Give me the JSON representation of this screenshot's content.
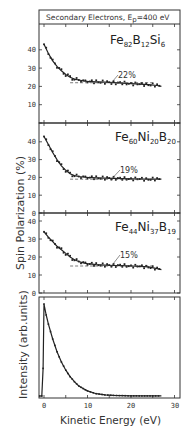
{
  "chart_data": [
    {
      "type": "scatter",
      "panel": "Fe82B12Si6",
      "title": "Secondary Electrons, Ep=400 eV",
      "label_main": [
        "Fe",
        "B",
        "Si"
      ],
      "label_subs": [
        "82",
        "12",
        "6"
      ],
      "annotation": "22%",
      "asymptote": 22,
      "xlabel": "Kinetic Energy (eV)",
      "ylabel": "Spin Polarization (%)",
      "xlim": [
        -1,
        32
      ],
      "ylim": [
        0,
        48
      ],
      "yticks": [
        0,
        10,
        20,
        30,
        40
      ],
      "x": [
        0,
        1,
        2,
        3,
        4,
        5,
        6,
        7,
        8,
        9,
        10,
        12,
        14,
        16,
        18,
        20,
        22,
        24,
        26,
        27
      ],
      "values": [
        43,
        38,
        34,
        31,
        28.5,
        26.5,
        25,
        24,
        23.5,
        23,
        22.8,
        22.5,
        22.3,
        22,
        21.8,
        21.5,
        21.2,
        21,
        20.5,
        20
      ]
    },
    {
      "type": "scatter",
      "panel": "Fe60Ni20B20",
      "label_main": [
        "Fe",
        "Ni",
        "B"
      ],
      "label_subs": [
        "60",
        "20",
        "20"
      ],
      "annotation": "19%",
      "asymptote": 19,
      "ylim": [
        0,
        48
      ],
      "yticks": [
        0,
        10,
        20,
        30,
        40
      ],
      "x": [
        0,
        1,
        2,
        3,
        4,
        5,
        6,
        7,
        8,
        9,
        10,
        12,
        14,
        16,
        18,
        20,
        22,
        24,
        26,
        27
      ],
      "values": [
        43,
        38.5,
        34,
        30,
        26.5,
        24,
        22,
        21,
        20.5,
        20.2,
        20,
        19.8,
        19.6,
        19.5,
        19.3,
        19.2,
        19.1,
        19,
        19,
        19
      ]
    },
    {
      "type": "scatter",
      "panel": "Fe44Ni37B19",
      "label_main": [
        "Fe",
        "Ni",
        "B"
      ],
      "label_subs": [
        "44",
        "37",
        "19"
      ],
      "annotation": "15%",
      "asymptote": 15,
      "ylim": [
        0,
        42
      ],
      "yticks": [
        0,
        10,
        20,
        30,
        40
      ],
      "x": [
        0,
        1,
        2,
        3,
        4,
        5,
        6,
        7,
        8,
        9,
        10,
        12,
        14,
        16,
        18,
        20,
        22,
        24,
        26,
        27
      ],
      "values": [
        34,
        31,
        28.5,
        26,
        24,
        22,
        20,
        18.5,
        17.5,
        16.8,
        16.3,
        15.8,
        15.5,
        15.3,
        15.2,
        15,
        14.8,
        14.5,
        13.5,
        13
      ]
    },
    {
      "type": "line",
      "panel": "Intensity",
      "ylabel": "Intensity (arb.units)",
      "xlabel": "Kinetic Energy (eV)",
      "xticks": [
        0,
        10,
        20,
        30
      ],
      "xlim": [
        -1,
        32
      ],
      "x": [
        -1,
        -0.5,
        -0.2,
        0,
        0.5,
        1,
        2,
        3,
        4,
        5,
        6,
        7,
        8,
        9,
        10,
        12,
        14,
        16,
        20,
        25,
        27
      ],
      "values": [
        0,
        0,
        30,
        100,
        88,
        78,
        62,
        48,
        37,
        28,
        21,
        15.5,
        11,
        8,
        5.5,
        2.5,
        1.2,
        0.6,
        0.2,
        0.1,
        0.1
      ]
    }
  ],
  "labels": {
    "title_prefix": "Secondary Electrons, E",
    "title_sub": "p",
    "title_suffix": "=400 eV",
    "ylabel_top": "Spin Polarization (%)",
    "ylabel_bottom": "Intensity (arb.units)",
    "xlabel": "Kinetic Energy (eV)",
    "p1_annot": "22%",
    "p2_annot": "19%",
    "p3_annot": "15%",
    "xt0": "0",
    "xt10": "10",
    "xt20": "20",
    "xt30": "30",
    "y0": "0",
    "y10": "10",
    "y20": "20",
    "y30": "30",
    "y40": "40",
    "f1a": "Fe",
    "f1as": "82",
    "f1b": "B",
    "f1bs": "12",
    "f1c": "Si",
    "f1cs": "6",
    "f2a": "Fe",
    "f2as": "60",
    "f2b": "Ni",
    "f2bs": "20",
    "f2c": "B",
    "f2cs": "20",
    "f3a": "Fe",
    "f3as": "44",
    "f3b": "Ni",
    "f3bs": "37",
    "f3c": "B",
    "f3cs": "19"
  }
}
